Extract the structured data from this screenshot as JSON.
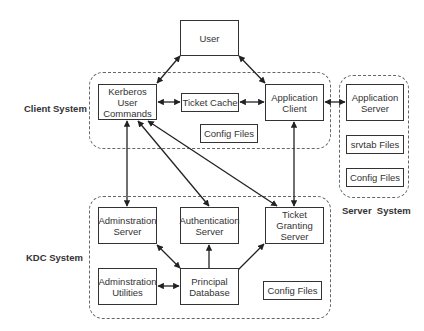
{
  "diagram": {
    "groups": [
      {
        "id": "client",
        "label": "Client System"
      },
      {
        "id": "server",
        "label": "Server  System"
      },
      {
        "id": "kdc",
        "label": "KDC System"
      }
    ],
    "nodes": {
      "user": "User",
      "kerberos_user_commands": "Kerberos\nUser\nCommands",
      "ticket_cache": "Ticket Cache",
      "application_client": "Application\nClient",
      "client_config_files": "Config Files",
      "application_server": "Application\nServer",
      "srvtab_files": "srvtab Files",
      "server_config_files": "Config Files",
      "administration_server": "Adminstration\nServer",
      "authentication_server": "Authentication\nServer",
      "ticket_granting_server": "Ticket\nGranting\nServer",
      "administration_utilities": "Adminstration\nUtilities",
      "principal_database": "Principal\nDatabase",
      "kdc_config_files": "Config Files"
    },
    "edges": [
      {
        "from": "user",
        "to": "kerberos_user_commands",
        "type": "bidirectional"
      },
      {
        "from": "user",
        "to": "application_client",
        "type": "bidirectional"
      },
      {
        "from": "kerberos_user_commands",
        "to": "ticket_cache",
        "type": "bidirectional"
      },
      {
        "from": "ticket_cache",
        "to": "application_client",
        "type": "bidirectional"
      },
      {
        "from": "application_client",
        "to": "application_server",
        "type": "bidirectional"
      },
      {
        "from": "kerberos_user_commands",
        "to": "administration_server",
        "type": "bidirectional"
      },
      {
        "from": "kerberos_user_commands",
        "to": "authentication_server",
        "type": "bidirectional"
      },
      {
        "from": "kerberos_user_commands",
        "to": "ticket_granting_server",
        "type": "bidirectional"
      },
      {
        "from": "application_client",
        "to": "ticket_granting_server",
        "type": "bidirectional"
      },
      {
        "from": "principal_database",
        "to": "administration_server",
        "type": "bidirectional"
      },
      {
        "from": "principal_database",
        "to": "authentication_server",
        "type": "directed"
      },
      {
        "from": "principal_database",
        "to": "ticket_granting_server",
        "type": "directed"
      },
      {
        "from": "administration_utilities",
        "to": "principal_database",
        "type": "bidirectional"
      }
    ]
  }
}
